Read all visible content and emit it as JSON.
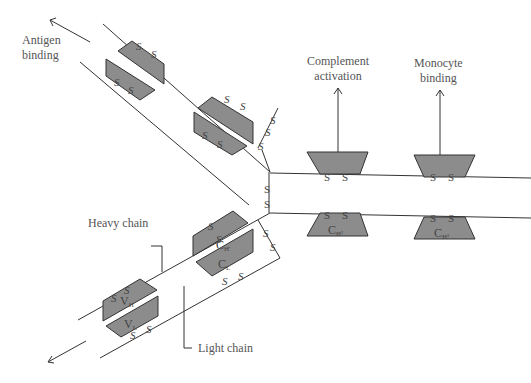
{
  "labels": {
    "antigen_binding": [
      "Antigen",
      "binding"
    ],
    "complement_activation": [
      "Complement",
      "activation"
    ],
    "monocyte_binding": [
      "Monocyte",
      "binding"
    ],
    "heavy_chain": "Heavy chain",
    "light_chain": "Light chain"
  },
  "domains": {
    "vh": "V",
    "vh_sub": "H",
    "vl": "V",
    "vl_sub": "L",
    "ch1": "C",
    "ch1_sub": "H'",
    "cl": "C",
    "cl_sub": "L",
    "ch2": "C",
    "ch2_sub": "H²",
    "ch3": "C",
    "ch3_sub": "H³"
  },
  "disulfide": "S",
  "colors": {
    "domain_fill": "#8c8c8c",
    "line": "#333333",
    "text": "#555555"
  }
}
